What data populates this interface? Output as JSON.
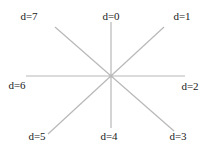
{
  "diagram": {
    "center": {
      "x": 111,
      "y": 76
    },
    "line_color": "#b8b8b8",
    "text_color": "#1a1a1a",
    "lines": [
      {
        "id": "vertical",
        "x1": 111,
        "y1": 22,
        "x2": 111,
        "y2": 128
      },
      {
        "id": "horizontal",
        "x1": 26,
        "y1": 76,
        "x2": 185,
        "y2": 76
      },
      {
        "id": "diag-7-3",
        "x1": 55,
        "y1": 27,
        "x2": 174,
        "y2": 131
      },
      {
        "id": "diag-1-5",
        "x1": 164,
        "y1": 27,
        "x2": 48,
        "y2": 134
      }
    ],
    "labels": [
      {
        "text": "d=0",
        "x": 111,
        "y": 16
      },
      {
        "text": "d=1",
        "x": 182,
        "y": 16
      },
      {
        "text": "d=2",
        "x": 190,
        "y": 86
      },
      {
        "text": "d=3",
        "x": 178,
        "y": 136
      },
      {
        "text": "d=4",
        "x": 109,
        "y": 136
      },
      {
        "text": "d=5",
        "x": 37,
        "y": 136
      },
      {
        "text": "d=6",
        "x": 17,
        "y": 85
      },
      {
        "text": "d=7",
        "x": 29,
        "y": 16
      }
    ]
  }
}
